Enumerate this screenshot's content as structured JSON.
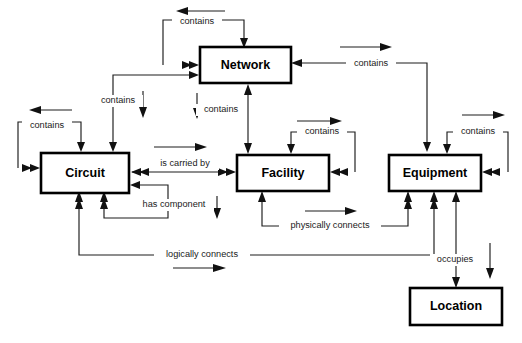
{
  "diagram": {
    "background_color": "#ffffff",
    "line_color": "#1c1c1c",
    "text_color": "#000000",
    "nodes": [
      {
        "id": "network",
        "label": "Network",
        "x": 200,
        "y": 47,
        "w": 91,
        "h": 36
      },
      {
        "id": "circuit",
        "label": "Circuit",
        "x": 41,
        "y": 153,
        "w": 88,
        "h": 40
      },
      {
        "id": "facility",
        "label": "Facility",
        "x": 237,
        "y": 155,
        "w": 92,
        "h": 36
      },
      {
        "id": "equipment",
        "label": "Equipment",
        "x": 389,
        "y": 155,
        "w": 92,
        "h": 36
      },
      {
        "id": "location",
        "label": "Location",
        "x": 410,
        "y": 288,
        "w": 92,
        "h": 37
      }
    ],
    "edge_labels": [
      {
        "id": "network-contains-self",
        "text": "contains",
        "x": 197,
        "y": 22
      },
      {
        "id": "circuit-contains-network",
        "text": "contains",
        "x": 118,
        "y": 101
      },
      {
        "id": "network-contains-facility",
        "text": "contains",
        "x": 221,
        "y": 110
      },
      {
        "id": "equipment-contains-network",
        "text": "contains",
        "x": 371,
        "y": 64
      },
      {
        "id": "circuit-contains-self",
        "text": "contains",
        "x": 47,
        "y": 126
      },
      {
        "id": "facility-contains-self",
        "text": "contains",
        "x": 322,
        "y": 136
      },
      {
        "id": "equipment-contains-self",
        "text": "contains",
        "x": 478,
        "y": 126
      },
      {
        "id": "circuit-is-carried-by",
        "text": "is carried by",
        "x": 185,
        "y": 164
      },
      {
        "id": "circuit-has-component",
        "text": "has component",
        "x": 174,
        "y": 205
      },
      {
        "id": "facility-physically-connects",
        "text": "physically connects",
        "x": 330,
        "y": 226
      },
      {
        "id": "circuit-logically-connects",
        "text": "logically connects",
        "x": 202,
        "y": 255
      },
      {
        "id": "equipment-occupies-location",
        "text": "occupies",
        "x": 455,
        "y": 260
      }
    ]
  }
}
